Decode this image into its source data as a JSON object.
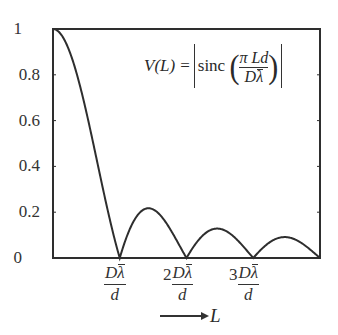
{
  "chart_data": {
    "type": "line",
    "title": "",
    "xlabel": "L",
    "ylabel": "",
    "annotation": "V(L) = |sinc(πLd / Dλ̄)|",
    "xlim": [
      0,
      4
    ],
    "ylim": [
      0,
      1
    ],
    "grid": false,
    "legend": "none",
    "x_unit": "Dλ̄/d",
    "y_ticks": [
      0,
      0.2,
      0.4,
      0.6,
      0.8,
      1
    ],
    "y_tick_labels": [
      "0",
      "0.2",
      "0.4",
      "0.6",
      "0.8",
      "1"
    ],
    "x_ticks": [
      1,
      2,
      3
    ],
    "x_tick_labels": [
      "Dλ̄/d",
      "2Dλ̄/d",
      "3Dλ̄/d"
    ],
    "series": [
      {
        "name": "V(L)",
        "x": [
          0,
          0.25,
          0.5,
          0.75,
          1.0,
          1.25,
          1.5,
          1.75,
          2.0,
          2.25,
          2.5,
          2.75,
          3.0,
          3.25,
          3.5,
          3.75,
          4.0
        ],
        "values": [
          1.0,
          0.9,
          0.64,
          0.3,
          0.0,
          0.18,
          0.21,
          0.13,
          0.0,
          0.1,
          0.13,
          0.08,
          0.0,
          0.07,
          0.09,
          0.06,
          0.0
        ]
      }
    ],
    "peaks": [
      {
        "x": 0,
        "y": 1.0
      },
      {
        "x": 1.43,
        "y": 0.217
      },
      {
        "x": 2.46,
        "y": 0.128
      },
      {
        "x": 3.47,
        "y": 0.091
      }
    ],
    "zeros": [
      1,
      2,
      3,
      4
    ]
  },
  "labels": {
    "formula_lhs": "V(L)",
    "formula_eq": "=",
    "formula_func": "sinc",
    "formula_num": "π Ld",
    "formula_den_D": "D",
    "formula_den_lambda": "λ",
    "tick_D": "D",
    "tick_lambda": "λ",
    "tick_d": "d",
    "tick_2": "2",
    "tick_3": "3",
    "axis_var": "L"
  }
}
